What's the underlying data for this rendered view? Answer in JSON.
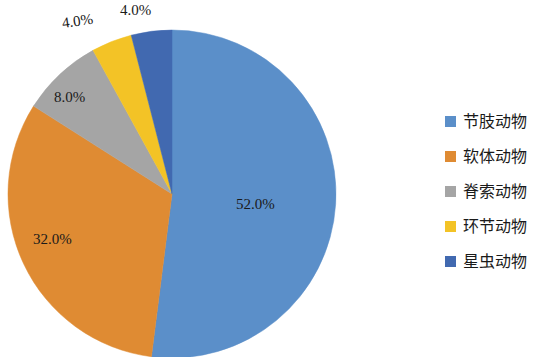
{
  "chart_data": {
    "type": "pie",
    "title": "",
    "categories": [
      "节肢动物",
      "软体动物",
      "脊索动物",
      "环节动物",
      "星虫动物"
    ],
    "values": [
      52.0,
      32.0,
      8.0,
      4.0,
      4.0
    ],
    "value_labels": [
      "52.0%",
      "32.0%",
      "8.0%",
      "4.0%",
      "4.0%"
    ],
    "colors": [
      "#5B8FC9",
      "#DF8B33",
      "#A5A5A5",
      "#F3C326",
      "#4169B0"
    ],
    "legend_position": "right",
    "grid": false,
    "start_angle_deg": 0,
    "direction": "clockwise"
  },
  "labels": {
    "arthropoda_pct": "52.0%",
    "mollusca_pct": "32.0%",
    "chordata_pct": "8.0%",
    "annelida_pct": "4.0%",
    "sipuncula_pct": "4.0%"
  },
  "legend": {
    "items": [
      {
        "label": "节肢动物",
        "color": "#5B8FC9"
      },
      {
        "label": "软体动物",
        "color": "#DF8B33"
      },
      {
        "label": "脊索动物",
        "color": "#A5A5A5"
      },
      {
        "label": "环节动物",
        "color": "#F3C326"
      },
      {
        "label": "星虫动物",
        "color": "#4169B0"
      }
    ]
  }
}
